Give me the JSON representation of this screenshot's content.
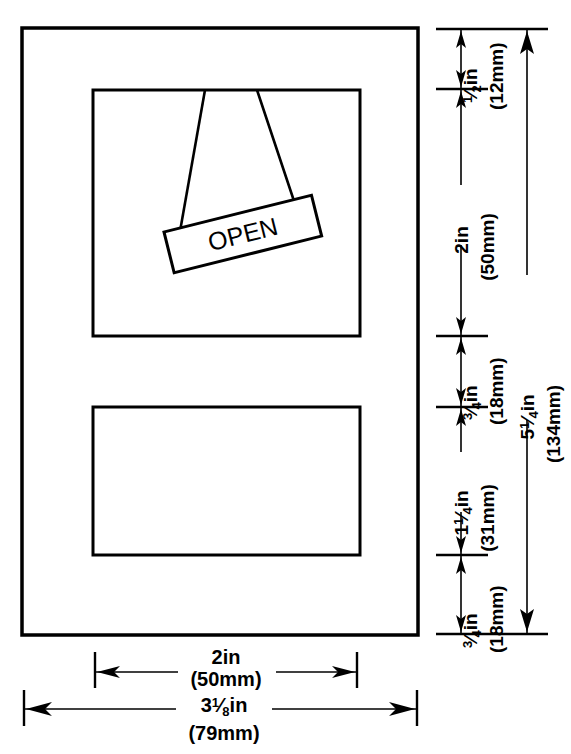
{
  "drawing": {
    "title": "Open sign mounting dimensions",
    "sign_label": "OPEN",
    "line_color": "#000000",
    "background_color": "#ffffff"
  },
  "vertical_dimensions": [
    {
      "id": "top-margin",
      "inch": "½in",
      "inch_whole": "",
      "inch_frac_num": "1",
      "inch_frac_den": "2",
      "inch_unit": "in",
      "mm": "(12mm)",
      "from_y": 29,
      "to_y": 89
    },
    {
      "id": "upper-window",
      "inch": "2in",
      "inch_whole": "2",
      "inch_frac_num": "",
      "inch_frac_den": "",
      "inch_unit": "in",
      "mm": "(50mm)",
      "from_y": 89,
      "to_y": 336
    },
    {
      "id": "between-windows-upper",
      "inch": "¾fin",
      "inch_whole": "",
      "inch_frac_num": "3",
      "inch_frac_den": "4",
      "inch_unit": "in",
      "mm": "(18mm)",
      "from_y": 336,
      "to_y": 407
    },
    {
      "id": "lower-window",
      "inch": "1¼in",
      "inch_whole": "1",
      "inch_frac_num": "1",
      "inch_frac_den": "4",
      "inch_unit": "in",
      "mm": "(31mm)",
      "from_y": 407,
      "to_y": 555
    },
    {
      "id": "bottom-margin",
      "inch": "¾fin",
      "inch_whole": "",
      "inch_frac_num": "3",
      "inch_frac_den": "4",
      "inch_unit": "in",
      "mm": "(18mm)",
      "from_y": 555,
      "to_y": 634
    }
  ],
  "overall_vertical": {
    "id": "overall-height",
    "inch_whole": "5",
    "inch_frac_num": "1",
    "inch_frac_den": "4",
    "inch_unit": "in",
    "inch": "5¼in",
    "mm": "(134mm)",
    "from_y": 29,
    "to_y": 634
  },
  "horizontal_dimensions": [
    {
      "id": "inner-width",
      "inch": "2in",
      "inch_whole": "2",
      "inch_frac_num": "",
      "inch_frac_den": "",
      "inch_unit": "in",
      "mm": "(50mm)",
      "from_x": 95,
      "to_x": 357
    },
    {
      "id": "overall-width",
      "inch": "3⅛in",
      "inch_whole": "3",
      "inch_frac_num": "1",
      "inch_frac_den": "8",
      "inch_unit": "in",
      "mm": "(79mm)",
      "from_x": 24,
      "to_x": 417
    }
  ],
  "shapes": {
    "outer_frame": {
      "x": 22,
      "y": 28,
      "width": 396,
      "height": 607
    },
    "upper_window": {
      "x": 93,
      "y": 90,
      "width": 267,
      "height": 246
    },
    "lower_window": {
      "x": 93,
      "y": 407,
      "width": 267,
      "height": 148
    },
    "sign": {
      "rotation_deg": -14,
      "width": 152,
      "height": 42
    },
    "strings": [
      {
        "top_x": 205,
        "top_y": 90,
        "bottom_x": 178,
        "bottom_y": 252
      },
      {
        "top_x": 257,
        "top_y": 90,
        "bottom_x": 305,
        "bottom_y": 236
      }
    ]
  }
}
